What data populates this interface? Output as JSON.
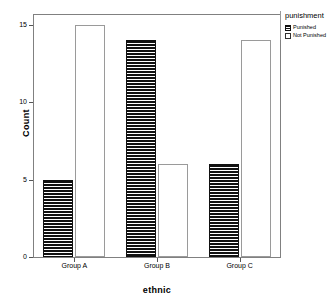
{
  "chart_data": {
    "type": "bar",
    "title": "",
    "xlabel": "ethnic",
    "ylabel": "Count",
    "categories": [
      "Group A",
      "Group B",
      "Group C"
    ],
    "series": [
      {
        "name": "Punished",
        "values": [
          5,
          14,
          6
        ],
        "fill": "horizontal-hatch",
        "color": "#111111"
      },
      {
        "name": "Not Punished",
        "values": [
          15,
          6,
          14
        ],
        "fill": "hollow",
        "color": "#ffffff"
      }
    ],
    "ylim": [
      0,
      15.7
    ],
    "yticks": [
      0,
      5,
      10,
      15
    ],
    "ytick_labels": [
      "0",
      "5",
      "10",
      "15"
    ],
    "grid": false,
    "legend": {
      "title": "punishment",
      "position": "right",
      "entries": [
        "Punished",
        "Not Punished"
      ]
    }
  },
  "axes": {
    "y_title": "Count",
    "x_title": "ethnic"
  },
  "legend": {
    "title": "punishment",
    "items": [
      {
        "label": "Punished"
      },
      {
        "label": "Not Punished"
      }
    ]
  }
}
